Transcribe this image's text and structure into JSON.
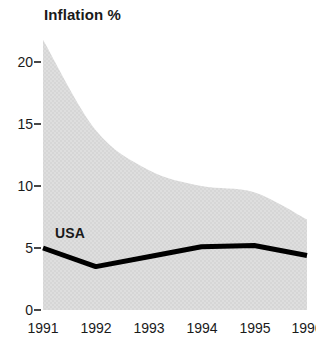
{
  "chart_data": {
    "type": "area",
    "title": "Inflation %",
    "xlabel": "",
    "ylabel": "",
    "grid": false,
    "legend": "inline-annotation",
    "x": [
      1991,
      1992,
      1993,
      1994,
      1995,
      1996
    ],
    "categories": [
      "1991",
      "1992",
      "1993",
      "1994",
      "1995",
      "1996"
    ],
    "xlim": [
      1991,
      1996
    ],
    "ylim": [
      0,
      22
    ],
    "y_ticks": [
      0,
      5,
      10,
      15,
      20
    ],
    "y_tick_labels": [
      "0",
      "5",
      "10",
      "15",
      "20"
    ],
    "x_tick_labels": [
      "1991",
      "1992",
      "1993",
      "1994",
      "1995",
      "1996"
    ],
    "series": [
      {
        "name": "USA",
        "type": "line",
        "color": "#000000",
        "values": [
          5.0,
          3.5,
          4.3,
          5.1,
          5.2,
          4.4
        ]
      },
      {
        "name": "range band",
        "type": "area",
        "color": "#dcdcdc",
        "upper": [
          21.8,
          14.5,
          11.3,
          10.0,
          9.5,
          7.3
        ],
        "lower": [
          0,
          0,
          0,
          0,
          0,
          0
        ]
      }
    ],
    "annotations": [
      {
        "text": "USA",
        "x": 1991.25,
        "y": 6.8
      }
    ]
  },
  "axis": {
    "y_labels": [
      "20",
      "15",
      "10",
      "5",
      "0"
    ],
    "x_labels": [
      "1991",
      "1992",
      "1993",
      "1994",
      "1995",
      "1996"
    ]
  },
  "colors": {
    "band": "#dcdcdc",
    "line": "#000000",
    "text": "#1a1a1a",
    "background": "#ffffff"
  }
}
